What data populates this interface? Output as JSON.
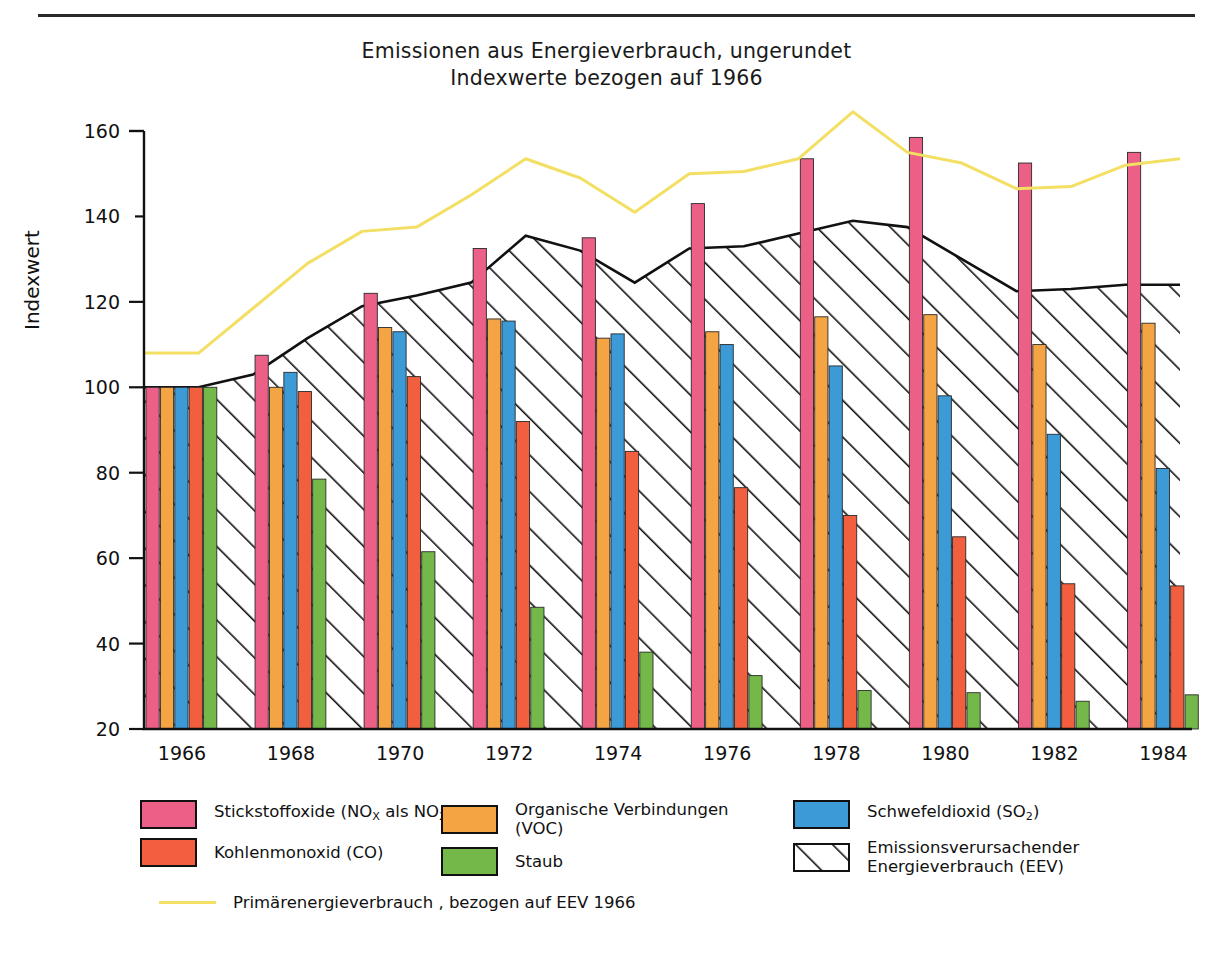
{
  "title": {
    "line1": "Emissionen aus Energieverbrauch, ungerundet",
    "line2": "Indexwerte bezogen auf 1966"
  },
  "axes": {
    "ylabel": "Indexwert",
    "yticks": [
      "20",
      "40",
      "60",
      "80",
      "100",
      "120",
      "140",
      "160"
    ],
    "xticks": [
      "1966",
      "1968",
      "1970",
      "1972",
      "1974",
      "1976",
      "1978",
      "1980",
      "1982",
      "1984"
    ]
  },
  "colors": {
    "nox": "#ec6087",
    "voc": "#f5a444",
    "so2": "#3c9ad6",
    "co": "#f25f3e",
    "staub": "#74b84a",
    "eev_line": "#111111",
    "primaer": "#f2df63",
    "outline": "#111111"
  },
  "legend": {
    "col1": [
      {
        "key": "nox",
        "label_html": "Stickstoffoxide (NO<sub>X</sub> als NO<sub>2</sub>)",
        "label": "Stickstoffoxide (NOX als NO2)"
      },
      {
        "key": "co",
        "label_html": "Kohlenmonoxid (CO)",
        "label": "Kohlenmonoxid (CO)"
      }
    ],
    "col2": [
      {
        "key": "voc",
        "label_html": "Organische Verbindungen<br>(VOC)",
        "label": "Organische Verbindungen (VOC)"
      },
      {
        "key": "staub",
        "label_html": "Staub",
        "label": "Staub"
      }
    ],
    "col3": [
      {
        "key": "so2",
        "label_html": "Schwefeldioxid (SO<sub>2</sub>)",
        "label": "Schwefeldioxid (SO2)"
      },
      {
        "key": "eev",
        "label_html": "Emissionsverursachender<br>Energieverbrauch (EEV)",
        "label": "Emissionsverursachender Energieverbrauch (EEV)"
      }
    ],
    "line_entry": {
      "key": "primaer",
      "label": "Primärenergieverbrauch , bezogen auf EEV 1966"
    }
  },
  "chart_data": {
    "type": "bar",
    "xlabel": "",
    "ylabel": "Indexwert",
    "ylim": [
      20,
      160
    ],
    "grid": false,
    "legend_position": "below",
    "categories": [
      "1966",
      "1968",
      "1970",
      "1972",
      "1974",
      "1976",
      "1978",
      "1980",
      "1982",
      "1984"
    ],
    "series": [
      {
        "name": "Stickstoffoxide (NOX als NO2)",
        "color": "#ec6087",
        "type": "bar",
        "values": [
          100,
          107.5,
          122,
          132.5,
          135,
          143,
          153.5,
          158.5,
          152.5,
          155
        ]
      },
      {
        "name": "Organische Verbindungen (VOC)",
        "color": "#f5a444",
        "type": "bar",
        "values": [
          100,
          100,
          114,
          116,
          111.5,
          113,
          116.5,
          117,
          110,
          115
        ]
      },
      {
        "name": "Schwefeldioxid (SO2)",
        "color": "#3c9ad6",
        "type": "bar",
        "values": [
          100,
          103.5,
          113,
          115.5,
          112.5,
          110,
          105,
          98,
          89,
          81
        ]
      },
      {
        "name": "Kohlenmonoxid (CO)",
        "color": "#f25f3e",
        "type": "bar",
        "values": [
          100,
          99,
          102.5,
          92,
          85,
          76.5,
          70,
          65,
          54,
          53.5
        ]
      },
      {
        "name": "Staub",
        "color": "#74b84a",
        "type": "bar",
        "values": [
          100,
          78.5,
          61.5,
          48.5,
          38,
          32.5,
          29,
          28.5,
          26.5,
          28
        ]
      }
    ],
    "area_series": {
      "name": "Emissionsverursachender Energieverbrauch (EEV)",
      "type": "area",
      "fill": "diagonal-hatch",
      "color": "#111111",
      "x": [
        1966,
        1967,
        1968,
        1969,
        1970,
        1971,
        1972,
        1973,
        1974,
        1975,
        1976,
        1977,
        1978,
        1979,
        1980,
        1981,
        1982,
        1983,
        1984
      ],
      "values": [
        100,
        100,
        103,
        111.5,
        119,
        121.5,
        124.5,
        135.5,
        132,
        124.5,
        132.5,
        133,
        136,
        139,
        137.5,
        130,
        122.5,
        123,
        124
      ]
    },
    "line_series": {
      "name": "Primärenergieverbrauch , bezogen auf EEV 1966",
      "type": "line",
      "color": "#f2df63",
      "x": [
        1966,
        1967,
        1968,
        1969,
        1970,
        1971,
        1972,
        1973,
        1974,
        1975,
        1976,
        1977,
        1978,
        1979,
        1980,
        1981,
        1982,
        1983,
        1984
      ],
      "values": [
        108,
        108,
        118.5,
        129,
        136.5,
        137.5,
        145,
        153.5,
        149,
        141,
        150,
        150.5,
        153.5,
        164.5,
        155,
        152.5,
        146.5,
        147,
        152
      ]
    }
  }
}
